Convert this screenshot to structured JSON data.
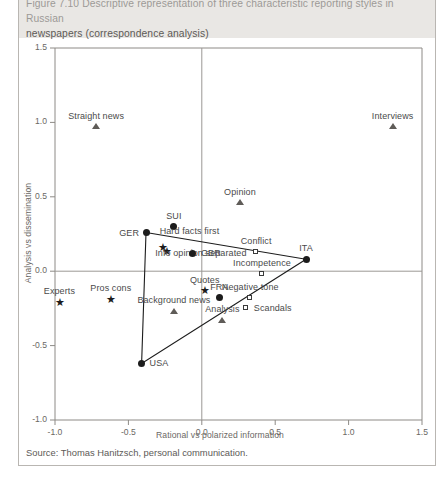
{
  "caption": {
    "line1": "Figure 7.10  Descriptive representation of three characteristic reporting styles in Russian",
    "line2": "newspapers (correspondence analysis)"
  },
  "source": "Source: Thomas Hanitzsch, personal communication.",
  "chart_data": {
    "type": "scatter",
    "title": "Descriptive representation of three characteristic reporting styles in Russian newspapers (correspondence analysis)",
    "xlabel": "Rational vs polarized information",
    "ylabel": "Analysis vs dissemination",
    "xlim": [
      -1.0,
      1.5
    ],
    "ylim": [
      -1.0,
      1.5
    ],
    "xticks": [
      "-1.0",
      "-0.5",
      "0.0",
      "0.5",
      "1.0",
      "1.5"
    ],
    "xtick_values": [
      -1.0,
      -0.5,
      0.0,
      0.5,
      1.0,
      1.5
    ],
    "yticks": [
      "1.5",
      "1.0",
      "0.5",
      "0.0",
      "-0.5",
      "-1.0"
    ],
    "ytick_values": [
      1.5,
      1.0,
      0.5,
      0.0,
      -0.5,
      -1.0
    ],
    "grid": false,
    "legend": "none",
    "axis_lines_at_zero": true,
    "marker_kinds": {
      "circle": "country",
      "triangle": "story-form",
      "square": "tone-attribute",
      "star": "information-practice"
    },
    "points": [
      {
        "label": "Straight news",
        "x": -0.72,
        "y": 0.97,
        "marker": "triangle",
        "label_pos": "above"
      },
      {
        "label": "Interviews",
        "x": 1.3,
        "y": 0.97,
        "marker": "triangle",
        "label_pos": "above"
      },
      {
        "label": "Opinion",
        "x": 0.26,
        "y": 0.46,
        "marker": "triangle",
        "label_pos": "above"
      },
      {
        "label": "SUI",
        "x": -0.19,
        "y": 0.3,
        "marker": "circle",
        "label_pos": "above"
      },
      {
        "label": "GER",
        "x": -0.38,
        "y": 0.26,
        "marker": "circle",
        "label_pos": "left"
      },
      {
        "label": "Hard facts first",
        "x": -0.26,
        "y": 0.21,
        "marker": "none",
        "label_pos": "above-right"
      },
      {
        "label": "",
        "x": -0.27,
        "y": 0.16,
        "marker": "star",
        "label_pos": "above"
      },
      {
        "label": "",
        "x": -0.24,
        "y": 0.13,
        "marker": "star",
        "label_pos": "above"
      },
      {
        "label": "Info opinion separated",
        "x": -0.29,
        "y": 0.06,
        "marker": "none",
        "label_pos": "above-right"
      },
      {
        "label": "GBR",
        "x": -0.06,
        "y": 0.12,
        "marker": "circle",
        "label_pos": "right"
      },
      {
        "label": "Conflict",
        "x": 0.37,
        "y": 0.13,
        "marker": "square",
        "label_pos": "above"
      },
      {
        "label": "ITA",
        "x": 0.71,
        "y": 0.08,
        "marker": "circle",
        "label_pos": "above"
      },
      {
        "label": "Incompetence",
        "x": 0.41,
        "y": -0.02,
        "marker": "square",
        "label_pos": "above"
      },
      {
        "label": "Quotes",
        "x": 0.02,
        "y": -0.13,
        "marker": "star",
        "label_pos": "above"
      },
      {
        "label": "FRA",
        "x": 0.12,
        "y": -0.18,
        "marker": "circle",
        "label_pos": "above"
      },
      {
        "label": "Negative tone",
        "x": 0.33,
        "y": -0.18,
        "marker": "square",
        "label_pos": "above"
      },
      {
        "label": "Scandals",
        "x": 0.3,
        "y": -0.25,
        "marker": "square",
        "label_pos": "right"
      },
      {
        "label": "Experts",
        "x": -0.97,
        "y": -0.21,
        "marker": "star",
        "label_pos": "above"
      },
      {
        "label": "Pros cons",
        "x": -0.62,
        "y": -0.19,
        "marker": "star",
        "label_pos": "above"
      },
      {
        "label": "Background news",
        "x": -0.19,
        "y": -0.27,
        "marker": "triangle",
        "label_pos": "above"
      },
      {
        "label": "Analysis",
        "x": 0.14,
        "y": -0.33,
        "marker": "triangle",
        "label_pos": "above"
      },
      {
        "label": "USA",
        "x": -0.41,
        "y": -0.62,
        "marker": "circle",
        "label_pos": "right"
      }
    ],
    "triangle_vertices": [
      "GER",
      "ITA",
      "USA"
    ]
  }
}
